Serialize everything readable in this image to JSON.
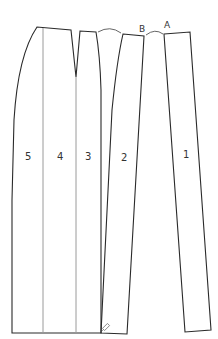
{
  "diagram": {
    "type": "sewing-pattern-pieces",
    "pieces": [
      {
        "id": "piece-1",
        "label": "1"
      },
      {
        "id": "piece-2",
        "label": "2"
      },
      {
        "id": "piece-3",
        "label": "3"
      },
      {
        "id": "piece-4",
        "label": "4"
      },
      {
        "id": "piece-5",
        "label": "5"
      }
    ],
    "points": [
      {
        "id": "point-a",
        "label": "A"
      },
      {
        "id": "point-b",
        "label": "B"
      }
    ],
    "colors": {
      "outline": "#2a2a2a",
      "divider": "#9a9a9a",
      "background": "#ffffff"
    }
  }
}
